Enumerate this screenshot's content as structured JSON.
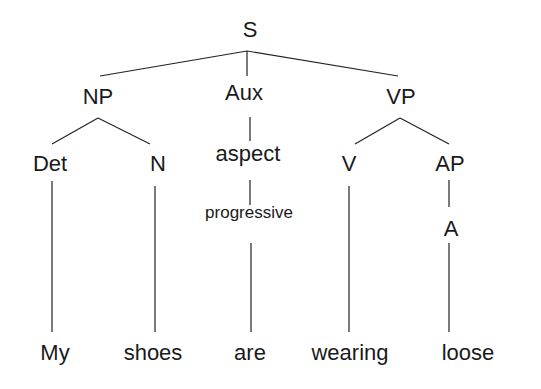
{
  "diagram": {
    "type": "syntax-tree",
    "sentence": "My shoes are wearing loose",
    "nodes": {
      "S": {
        "label": "S",
        "x": 250,
        "y": 30
      },
      "NP": {
        "label": "NP",
        "x": 98,
        "y": 97
      },
      "Aux": {
        "label": "Aux",
        "x": 244,
        "y": 93
      },
      "VP": {
        "label": "VP",
        "x": 401,
        "y": 97
      },
      "Det": {
        "label": "Det",
        "x": 50,
        "y": 164
      },
      "N": {
        "label": "N",
        "x": 158,
        "y": 164
      },
      "aspect": {
        "label": "aspect",
        "x": 248,
        "y": 154
      },
      "progressive": {
        "label": "progressive",
        "x": 249,
        "y": 212
      },
      "V": {
        "label": "V",
        "x": 349,
        "y": 164
      },
      "AP": {
        "label": "AP",
        "x": 450,
        "y": 164
      },
      "A": {
        "label": "A",
        "x": 451,
        "y": 229
      },
      "My": {
        "label": "My",
        "x": 55,
        "y": 353
      },
      "shoes": {
        "label": "shoes",
        "x": 153,
        "y": 353
      },
      "are": {
        "label": "are",
        "x": 250,
        "y": 353
      },
      "wearing": {
        "label": "wearing",
        "x": 350,
        "y": 353
      },
      "loose": {
        "label": "loose",
        "x": 468,
        "y": 353
      }
    },
    "edges": [
      {
        "from": "S",
        "to": "NP"
      },
      {
        "from": "S",
        "to": "Aux"
      },
      {
        "from": "S",
        "to": "VP"
      },
      {
        "from": "NP",
        "to": "Det"
      },
      {
        "from": "NP",
        "to": "N"
      },
      {
        "from": "Aux",
        "to": "aspect"
      },
      {
        "from": "aspect",
        "to": "progressive"
      },
      {
        "from": "VP",
        "to": "V"
      },
      {
        "from": "VP",
        "to": "AP"
      },
      {
        "from": "AP",
        "to": "A"
      },
      {
        "from": "Det",
        "to": "My"
      },
      {
        "from": "N",
        "to": "shoes"
      },
      {
        "from": "progressive",
        "to": "are"
      },
      {
        "from": "V",
        "to": "wearing"
      },
      {
        "from": "A",
        "to": "loose"
      }
    ]
  }
}
